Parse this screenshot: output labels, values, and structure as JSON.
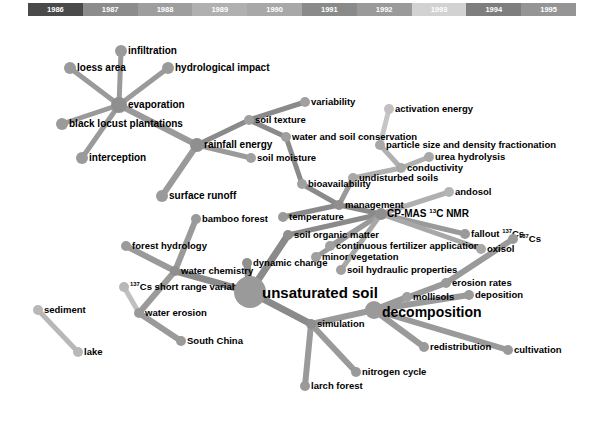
{
  "figure": {
    "type": "network-graph",
    "title": ""
  },
  "timeline": {
    "name": "year-color-legend",
    "segments": [
      {
        "year": "1986",
        "color": "#4a4a4a"
      },
      {
        "year": "1987",
        "color": "#8c8c8c"
      },
      {
        "year": "1988",
        "color": "#9e9e9e"
      },
      {
        "year": "1989",
        "color": "#b0b0b0"
      },
      {
        "year": "1990",
        "color": "#a8a8a8"
      },
      {
        "year": "1991",
        "color": "#8a8a8a"
      },
      {
        "year": "1992",
        "color": "#9a9a9a"
      },
      {
        "year": "1993",
        "color": "#d2d2d2"
      },
      {
        "year": "1994",
        "color": "#7e7e7e"
      },
      {
        "year": "1995",
        "color": "#959595"
      }
    ]
  },
  "chart_data": {
    "type": "scatter",
    "title": "",
    "xlabel": "",
    "ylabel": "",
    "nodes": [
      {
        "label": "infiltration",
        "x": 121,
        "y": 51,
        "size": 6,
        "font": 10,
        "lx": 128,
        "ly": 51,
        "color": "#9a9a9a"
      },
      {
        "label": "loess area",
        "x": 70,
        "y": 68,
        "size": 6,
        "font": 10,
        "lx": 77,
        "ly": 68,
        "color": "#9a9a9a"
      },
      {
        "label": "hydrological impact",
        "x": 168,
        "y": 68,
        "size": 6,
        "font": 10,
        "lx": 175,
        "ly": 68,
        "color": "#9a9a9a"
      },
      {
        "label": "evaporation",
        "x": 119,
        "y": 105,
        "size": 8,
        "font": 10,
        "lx": 128,
        "ly": 105,
        "color": "#8f8f8f"
      },
      {
        "label": "black locust plantations",
        "x": 62,
        "y": 124,
        "size": 6,
        "font": 10,
        "lx": 69,
        "ly": 124,
        "color": "#9a9a9a"
      },
      {
        "label": "interception",
        "x": 82,
        "y": 158,
        "size": 6,
        "font": 10,
        "lx": 89,
        "ly": 158,
        "color": "#9a9a9a"
      },
      {
        "label": "rainfall energy",
        "x": 197,
        "y": 145,
        "size": 7,
        "font": 10,
        "lx": 204,
        "ly": 145,
        "color": "#8f8f8f"
      },
      {
        "label": "surface runoff",
        "x": 162,
        "y": 196,
        "size": 6,
        "font": 10,
        "lx": 169,
        "ly": 196,
        "color": "#9a9a9a"
      },
      {
        "label": "soil texture",
        "x": 249,
        "y": 120,
        "size": 5,
        "font": 9.5,
        "lx": 255,
        "ly": 120,
        "color": "#a0a0a0"
      },
      {
        "label": "soil moisture",
        "x": 251,
        "y": 158,
        "size": 5,
        "font": 9.5,
        "lx": 257,
        "ly": 158,
        "color": "#a0a0a0"
      },
      {
        "label": "variability",
        "x": 305,
        "y": 102,
        "size": 5,
        "font": 9.5,
        "lx": 311,
        "ly": 102,
        "color": "#a0a0a0"
      },
      {
        "label": "water and soil conservation",
        "x": 286,
        "y": 137,
        "size": 5,
        "font": 9.5,
        "lx": 292,
        "ly": 137,
        "color": "#a0a0a0"
      },
      {
        "label": "activation energy",
        "x": 389,
        "y": 109,
        "size": 5,
        "font": 9.5,
        "lx": 395,
        "ly": 109,
        "color": "#c0c0c0"
      },
      {
        "label": "particle size and density fractionation",
        "x": 380,
        "y": 145,
        "size": 5,
        "font": 9.5,
        "lx": 386,
        "ly": 145,
        "color": "#a8a8a8"
      },
      {
        "label": "urea hydrolysis",
        "x": 429,
        "y": 157,
        "size": 5,
        "font": 9.5,
        "lx": 435,
        "ly": 157,
        "color": "#a8a8a8"
      },
      {
        "label": "conductivity",
        "x": 401,
        "y": 168,
        "size": 5,
        "font": 9.5,
        "lx": 407,
        "ly": 168,
        "color": "#a8a8a8"
      },
      {
        "label": "undisturbed soils",
        "x": 353,
        "y": 178,
        "size": 5,
        "font": 9.5,
        "lx": 359,
        "ly": 178,
        "color": "#a8a8a8"
      },
      {
        "label": "bioavailability",
        "x": 302,
        "y": 184,
        "size": 5,
        "font": 9.5,
        "lx": 308,
        "ly": 184,
        "color": "#a0a0a0"
      },
      {
        "label": "andosol",
        "x": 449,
        "y": 192,
        "size": 5,
        "font": 9.5,
        "lx": 455,
        "ly": 192,
        "color": "#b4b4b4"
      },
      {
        "label": "management",
        "x": 339,
        "y": 205,
        "size": 5,
        "font": 9.5,
        "lx": 345,
        "ly": 205,
        "color": "#8f8f8f"
      },
      {
        "label": "bamboo forest",
        "x": 196,
        "y": 219,
        "size": 5,
        "font": 9.5,
        "lx": 202,
        "ly": 219,
        "color": "#9a9a9a"
      },
      {
        "label": "temperature",
        "x": 283,
        "y": 217,
        "size": 5,
        "font": 9.5,
        "lx": 289,
        "ly": 217,
        "color": "#9a9a9a"
      },
      {
        "label": "CP-MAS <sup>13</sup>C NMR",
        "x": 381,
        "y": 214,
        "size": 6,
        "font": 10,
        "lx": 387,
        "ly": 214,
        "color": "#8f8f8f"
      },
      {
        "label": "forest hydrology",
        "x": 126,
        "y": 246,
        "size": 5,
        "font": 9.5,
        "lx": 132,
        "ly": 246,
        "color": "#9a9a9a"
      },
      {
        "label": "soil organic matter",
        "x": 288,
        "y": 235,
        "size": 5,
        "font": 9.5,
        "lx": 294,
        "ly": 235,
        "color": "#8f8f8f"
      },
      {
        "label": "continuous fertilizer application",
        "x": 330,
        "y": 246,
        "size": 5,
        "font": 9.5,
        "lx": 336,
        "ly": 246,
        "color": "#a0a0a0"
      },
      {
        "label": "fallout <sup>137</sup>Cs",
        "x": 465,
        "y": 234,
        "size": 5,
        "font": 9.5,
        "lx": 471,
        "ly": 234,
        "color": "#9a9a9a"
      },
      {
        "label": "<sup>137</sup>Cs",
        "x": 513,
        "y": 239,
        "size": 5,
        "font": 9.5,
        "lx": 519,
        "ly": 239,
        "color": "#9a9a9a"
      },
      {
        "label": "dynamic change",
        "x": 247,
        "y": 263,
        "size": 5,
        "font": 9.5,
        "lx": 253,
        "ly": 263,
        "color": "#8f8f8f"
      },
      {
        "label": "minor vegetation",
        "x": 316,
        "y": 257,
        "size": 5,
        "font": 9.5,
        "lx": 322,
        "ly": 257,
        "color": "#a0a0a0"
      },
      {
        "label": "oxisol",
        "x": 481,
        "y": 249,
        "size": 5,
        "font": 9.5,
        "lx": 487,
        "ly": 249,
        "color": "#a8a8a8"
      },
      {
        "label": "water chemistry",
        "x": 175,
        "y": 271,
        "size": 5,
        "font": 9.5,
        "lx": 181,
        "ly": 271,
        "color": "#8f8f8f"
      },
      {
        "label": "soil hydraulic properties",
        "x": 341,
        "y": 270,
        "size": 5,
        "font": 9.5,
        "lx": 347,
        "ly": 270,
        "color": "#a0a0a0"
      },
      {
        "label": "erosion rates",
        "x": 446,
        "y": 283,
        "size": 5,
        "font": 9.5,
        "lx": 452,
        "ly": 283,
        "color": "#9a9a9a"
      },
      {
        "label": "<sup>137</sup>Cs short range variability",
        "x": 124,
        "y": 287,
        "size": 5,
        "font": 9.5,
        "lx": 130,
        "ly": 287,
        "color": "#b8b8b8"
      },
      {
        "label": "unsaturated soil",
        "x": 250,
        "y": 292,
        "size": 16,
        "font": 15,
        "lx": 262,
        "ly": 292,
        "color": "#9a9a9a"
      },
      {
        "label": "mollisols",
        "x": 407,
        "y": 297,
        "size": 5,
        "font": 9.5,
        "lx": 413,
        "ly": 297,
        "color": "#a0a0a0"
      },
      {
        "label": "deposition",
        "x": 469,
        "y": 295,
        "size": 5,
        "font": 9.5,
        "lx": 475,
        "ly": 295,
        "color": "#9a9a9a"
      },
      {
        "label": "sediment",
        "x": 38,
        "y": 310,
        "size": 5,
        "font": 9.5,
        "lx": 44,
        "ly": 310,
        "color": "#b8b8b8"
      },
      {
        "label": "water erosion",
        "x": 139,
        "y": 313,
        "size": 5,
        "font": 9.5,
        "lx": 145,
        "ly": 313,
        "color": "#9a9a9a"
      },
      {
        "label": "simulation",
        "x": 311,
        "y": 324,
        "size": 5,
        "font": 9.5,
        "lx": 317,
        "ly": 324,
        "color": "#8f8f8f"
      },
      {
        "label": "decomposition",
        "x": 374,
        "y": 310,
        "size": 9,
        "font": 14,
        "lx": 382,
        "ly": 312,
        "color": "#9a9a9a"
      },
      {
        "label": "lake",
        "x": 78,
        "y": 352,
        "size": 5,
        "font": 9.5,
        "lx": 84,
        "ly": 352,
        "color": "#b8b8b8"
      },
      {
        "label": "South China",
        "x": 181,
        "y": 341,
        "size": 5,
        "font": 9.5,
        "lx": 187,
        "ly": 341,
        "color": "#9a9a9a"
      },
      {
        "label": "redistribution",
        "x": 424,
        "y": 347,
        "size": 5,
        "font": 9.5,
        "lx": 430,
        "ly": 347,
        "color": "#9a9a9a"
      },
      {
        "label": "cultivation",
        "x": 508,
        "y": 350,
        "size": 5,
        "font": 9.5,
        "lx": 514,
        "ly": 350,
        "color": "#9a9a9a"
      },
      {
        "label": "nitrogen cycle",
        "x": 356,
        "y": 372,
        "size": 5,
        "font": 9.5,
        "lx": 362,
        "ly": 372,
        "color": "#9a9a9a"
      },
      {
        "label": "larch forest",
        "x": 305,
        "y": 386,
        "size": 5,
        "font": 9.5,
        "lx": 311,
        "ly": 386,
        "color": "#9a9a9a"
      }
    ],
    "edges": [
      {
        "from": "evaporation",
        "to": "infiltration",
        "color": "#9a9a9a",
        "w": 5
      },
      {
        "from": "evaporation",
        "to": "loess area",
        "color": "#9a9a9a",
        "w": 5
      },
      {
        "from": "evaporation",
        "to": "hydrological impact",
        "color": "#9a9a9a",
        "w": 5
      },
      {
        "from": "evaporation",
        "to": "black locust plantations",
        "color": "#9a9a9a",
        "w": 5
      },
      {
        "from": "evaporation",
        "to": "interception",
        "color": "#9a9a9a",
        "w": 5
      },
      {
        "from": "evaporation",
        "to": "rainfall energy",
        "color": "#9a9a9a",
        "w": 6
      },
      {
        "from": "rainfall energy",
        "to": "surface runoff",
        "color": "#9a9a9a",
        "w": 6
      },
      {
        "from": "rainfall energy",
        "to": "soil moisture",
        "color": "#9a9a9a",
        "w": 5
      },
      {
        "from": "rainfall energy",
        "to": "soil texture",
        "color": "#8a8a8a",
        "w": 5
      },
      {
        "from": "soil texture",
        "to": "variability",
        "color": "#8a8a8a",
        "w": 5
      },
      {
        "from": "soil texture",
        "to": "water and soil conservation",
        "color": "#8a8a8a",
        "w": 5
      },
      {
        "from": "water and soil conservation",
        "to": "bioavailability",
        "color": "#8a8a8a",
        "w": 5
      },
      {
        "from": "bioavailability",
        "to": "management",
        "color": "#8a8a8a",
        "w": 5
      },
      {
        "from": "undisturbed soils",
        "to": "management",
        "color": "#9a9a9a",
        "w": 5
      },
      {
        "from": "undisturbed soils",
        "to": "conductivity",
        "color": "#b0b0b0",
        "w": 5
      },
      {
        "from": "conductivity",
        "to": "urea hydrolysis",
        "color": "#b0b0b0",
        "w": 5
      },
      {
        "from": "conductivity",
        "to": "particle size and density fractionation",
        "color": "#b0b0b0",
        "w": 5
      },
      {
        "from": "particle size and density fractionation",
        "to": "activation energy",
        "color": "#c6c6c6",
        "w": 5
      },
      {
        "from": "management",
        "to": "CP-MAS <sup>13</sup>C NMR",
        "color": "#8a8a8a",
        "w": 5
      },
      {
        "from": "management",
        "to": "temperature",
        "color": "#8a8a8a",
        "w": 5
      },
      {
        "from": "CP-MAS <sup>13</sup>C NMR",
        "to": "andosol",
        "color": "#b0b0b0",
        "w": 5
      },
      {
        "from": "CP-MAS <sup>13</sup>C NMR",
        "to": "soil organic matter",
        "color": "#8a8a8a",
        "w": 5
      },
      {
        "from": "CP-MAS <sup>13</sup>C NMR",
        "to": "continuous fertilizer application",
        "color": "#9a9a9a",
        "w": 5
      },
      {
        "from": "CP-MAS <sup>13</sup>C NMR",
        "to": "minor vegetation",
        "color": "#9a9a9a",
        "w": 5
      },
      {
        "from": "CP-MAS <sup>13</sup>C NMR",
        "to": "fallout <sup>137</sup>Cs",
        "color": "#9a9a9a",
        "w": 5
      },
      {
        "from": "CP-MAS <sup>13</sup>C NMR",
        "to": "oxisol",
        "color": "#a8a8a8",
        "w": 5
      },
      {
        "from": "CP-MAS <sup>13</sup>C NMR",
        "to": "soil hydraulic properties",
        "color": "#a8a8a8",
        "w": 5
      },
      {
        "from": "unsaturated soil",
        "to": "soil organic matter",
        "color": "#8a8a8a",
        "w": 7
      },
      {
        "from": "unsaturated soil",
        "to": "dynamic change",
        "color": "#8a8a8a",
        "w": 7
      },
      {
        "from": "unsaturated soil",
        "to": "water chemistry",
        "color": "#8a8a8a",
        "w": 7
      },
      {
        "from": "unsaturated soil",
        "to": "simulation",
        "color": "#8a8a8a",
        "w": 7
      },
      {
        "from": "water chemistry",
        "to": "forest hydrology",
        "color": "#9a9a9a",
        "w": 6
      },
      {
        "from": "water chemistry",
        "to": "bamboo forest",
        "color": "#9a9a9a",
        "w": 6
      },
      {
        "from": "water chemistry",
        "to": "water erosion",
        "color": "#9a9a9a",
        "w": 6
      },
      {
        "from": "water erosion",
        "to": "South China",
        "color": "#9a9a9a",
        "w": 6
      },
      {
        "from": "<sup>137</sup>Cs short range variability",
        "to": "water erosion",
        "color": "#c0c0c0",
        "w": 5
      },
      {
        "from": "sediment",
        "to": "lake",
        "color": "#b8b8b8",
        "w": 5
      },
      {
        "from": "simulation",
        "to": "decomposition",
        "color": "#9a9a9a",
        "w": 6
      },
      {
        "from": "simulation",
        "to": "nitrogen cycle",
        "color": "#9a9a9a",
        "w": 6
      },
      {
        "from": "simulation",
        "to": "larch forest",
        "color": "#9a9a9a",
        "w": 6
      },
      {
        "from": "decomposition",
        "to": "mollisols",
        "color": "#9a9a9a",
        "w": 6
      },
      {
        "from": "decomposition",
        "to": "erosion rates",
        "color": "#9a9a9a",
        "w": 6
      },
      {
        "from": "decomposition",
        "to": "deposition",
        "color": "#9a9a9a",
        "w": 6
      },
      {
        "from": "decomposition",
        "to": "redistribution",
        "color": "#9a9a9a",
        "w": 6
      },
      {
        "from": "decomposition",
        "to": "cultivation",
        "color": "#9a9a9a",
        "w": 6
      },
      {
        "from": "erosion rates",
        "to": "<sup>137</sup>Cs",
        "color": "#9a9a9a",
        "w": 6
      }
    ]
  }
}
